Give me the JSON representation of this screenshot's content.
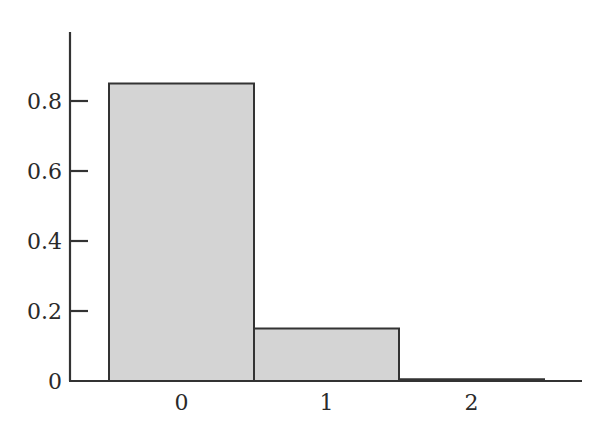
{
  "chart_data": {
    "type": "bar",
    "title": "",
    "xlabel": "",
    "ylabel": "",
    "categories": [
      "0",
      "1",
      "2"
    ],
    "values": [
      0.85,
      0.15,
      0.005
    ],
    "ylim": [
      0,
      0.95
    ],
    "yticks": [
      0,
      0.2,
      0.4,
      0.6,
      0.8
    ],
    "ytick_labels": [
      "0",
      "0.2",
      "0.4",
      "0.6",
      "0.8"
    ],
    "grid": false,
    "legend": null,
    "colors": {
      "bar_fill": "#d4d4d4",
      "bar_edge": "#333333",
      "axis": "#333333"
    }
  }
}
